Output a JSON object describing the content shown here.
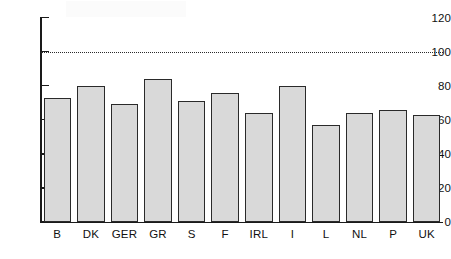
{
  "chart_data": {
    "type": "bar",
    "title": "",
    "subtitle": "",
    "xlabel": "",
    "ylabel": "",
    "categories": [
      "B",
      "DK",
      "GER",
      "GR",
      "S",
      "F",
      "IRL",
      "I",
      "L",
      "NL",
      "P",
      "UK"
    ],
    "values": [
      73,
      80,
      69,
      84,
      71,
      76,
      64,
      80,
      57,
      64,
      66,
      63
    ],
    "series": [
      {
        "name": "",
        "values": [
          73,
          80,
          69,
          84,
          71,
          76,
          64,
          80,
          57,
          64,
          66,
          63
        ]
      }
    ],
    "ylim": [
      0,
      120
    ],
    "yticks": [
      0,
      20,
      40,
      60,
      80,
      100,
      120
    ],
    "ytick_labels": [
      "0",
      "20",
      "40",
      "60",
      "80",
      "100",
      "120"
    ],
    "xtick_labels": [
      "B",
      "DK",
      "GER",
      "GR",
      "S",
      "F",
      "IRL",
      "I",
      "L",
      "NL",
      "P",
      "UK"
    ],
    "grid": false,
    "legend": null,
    "legend_position": "none",
    "annotations": [
      {
        "name": "reference-line",
        "type": "horizontal-dotted-line",
        "value": 100,
        "label": ""
      }
    ],
    "colors": {
      "bar_fill": "#d9d9d9",
      "bar_border": "#2a2a2a",
      "axis": "#1a1a1a",
      "reference_line": "#2b2b2b",
      "background": "#ffffff",
      "text": "#111111"
    }
  }
}
